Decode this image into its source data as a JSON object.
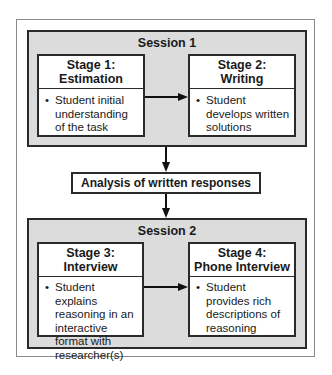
{
  "session1": {
    "title": "Session 1",
    "stage1": {
      "title_line1": "Stage 1:",
      "title_line2": "Estimation",
      "bullet": "•",
      "text": "Student initial understanding of the task"
    },
    "stage2": {
      "title_line1": "Stage 2:",
      "title_line2": "Writing",
      "bullet": "•",
      "text": "Student develops written solutions"
    }
  },
  "analysis": {
    "label": "Analysis of written responses"
  },
  "session2": {
    "title": "Session 2",
    "stage3": {
      "title_line1": "Stage 3:",
      "title_line2": "Interview",
      "bullet": "•",
      "text": "Student explains reasoning in an interactive format with researcher(s)"
    },
    "stage4": {
      "title_line1": "Stage 4:",
      "title_line2": "Phone Interview",
      "bullet": "•",
      "text": "Student provides rich descriptions of reasoning"
    }
  },
  "colors": {
    "session_fill": "#dcdcdc",
    "border": "#2a2a2a",
    "frame": "#8a8a8a"
  }
}
